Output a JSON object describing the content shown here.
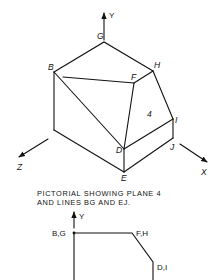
{
  "pictorial": {
    "axis_labels": {
      "y": "Y",
      "x": "X",
      "z": "Z"
    },
    "vertex_labels": {
      "G": "G",
      "B": "B",
      "H": "H",
      "F": "F",
      "I": "I",
      "J": "J",
      "D": "D",
      "E": "E"
    },
    "plane_label": "4"
  },
  "caption": {
    "line1": "PICTORIAL SHOWING PLANE 4",
    "line2": "AND LINES BG AND EJ."
  },
  "front_view": {
    "axis_label_y": "Y",
    "point_labels": {
      "bg": "B,G",
      "fh": "F,H",
      "di": "D,I"
    }
  }
}
